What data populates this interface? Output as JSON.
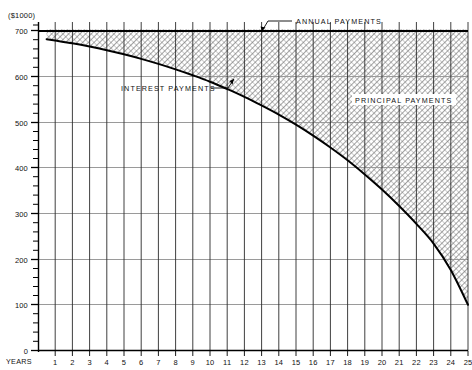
{
  "chart_data": {
    "type": "area",
    "title": "",
    "subtitle": "",
    "xlabel": "YEARS",
    "ylabel": "($1000)",
    "xlim": [
      0,
      25
    ],
    "ylim": [
      0,
      730
    ],
    "grid": true,
    "legend_position": "inline-annotations",
    "x_ticks": [
      "1",
      "2",
      "3",
      "4",
      "5",
      "6",
      "7",
      "8",
      "9",
      "10",
      "11",
      "12",
      "13",
      "14",
      "15",
      "16",
      "17",
      "18",
      "19",
      "20",
      "21",
      "22",
      "23",
      "24",
      "25"
    ],
    "y_ticks": [
      "0",
      "100",
      "200",
      "300",
      "400",
      "500",
      "600",
      "700"
    ],
    "y_minor_tick_step": 20,
    "x": [
      0.5,
      1,
      2,
      3,
      4,
      5,
      6,
      7,
      8,
      9,
      10,
      11,
      12,
      13,
      14,
      15,
      16,
      17,
      18,
      19,
      20,
      21,
      22,
      23,
      24,
      25
    ],
    "series": [
      {
        "name": "ANNUAL PAYMENTS",
        "style": "solid-top-line",
        "values": [
          703,
          703,
          703,
          703,
          703,
          703,
          703,
          703,
          703,
          703,
          703,
          703,
          703,
          703,
          703,
          703,
          703,
          703,
          703,
          703,
          703,
          703,
          703,
          703,
          703,
          703
        ]
      },
      {
        "name": "INTEREST PAYMENTS",
        "style": "curve-lower-boundary",
        "values": [
          681,
          678,
          672,
          665,
          657,
          648,
          638,
          627,
          615,
          602,
          588,
          572,
          555,
          536,
          516,
          494,
          470,
          444,
          416,
          385,
          352,
          316,
          277,
          234,
          176,
          100
        ]
      }
    ],
    "fill_region": {
      "name": "PRINCIPAL PAYMENTS",
      "between": [
        "INTEREST PAYMENTS",
        "ANNUAL PAYMENTS"
      ],
      "pattern": "cross-hatch"
    },
    "annotations": [
      {
        "id": "annual",
        "text": "ANNUAL PAYMENTS",
        "x": 296,
        "y": 22,
        "leader": "M 291,24 L 278,26 L 272,33"
      },
      {
        "id": "interest",
        "text": "INTEREST PAYMENTS",
        "x": 121,
        "y": 88,
        "leader": "M 213,86 L 228,86 L 233,78"
      },
      {
        "id": "principal",
        "text": "PRINCIPAL PAYMENTS",
        "x": 355,
        "y": 100,
        "leader": ""
      }
    ],
    "colors": {
      "curve": "#000000",
      "top_line": "#000000",
      "vertical_grid": "#2a2a2a",
      "horizontal_grid": "#9a9a9a",
      "axis": "#000000",
      "hatch": "#5d5d5d",
      "text": "#111111",
      "background": "#ffffff"
    }
  },
  "plot_geometry": {
    "left": 38,
    "right": 468,
    "top": 30,
    "bottom": 350
  }
}
